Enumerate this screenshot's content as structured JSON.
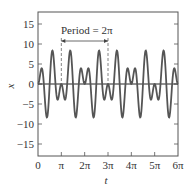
{
  "chart_data": {
    "type": "line",
    "title": "",
    "xlabel": "t",
    "ylabel": "x",
    "xlim": [
      0,
      18.8496
    ],
    "ylim": [
      -18,
      18
    ],
    "grid": false,
    "legend": null,
    "x_ticks": [
      {
        "value": 0,
        "label": "0"
      },
      {
        "value": 3.1416,
        "label": "π"
      },
      {
        "value": 6.2832,
        "label": "2π"
      },
      {
        "value": 9.4248,
        "label": "3π"
      },
      {
        "value": 12.5664,
        "label": "4π"
      },
      {
        "value": 15.708,
        "label": "5π"
      },
      {
        "value": 18.8496,
        "label": "6π"
      }
    ],
    "y_ticks": [
      {
        "value": 15,
        "label": "15"
      },
      {
        "value": 10,
        "label": "10"
      },
      {
        "value": 5,
        "label": "5"
      },
      {
        "value": 0,
        "label": "0"
      },
      {
        "value": -5,
        "label": "−5"
      },
      {
        "value": -10,
        "label": "−10"
      },
      {
        "value": -15,
        "label": "−15"
      }
    ],
    "series": [
      {
        "name": "x(t)",
        "formula": "x = 4.5[cos(3t) − cos(5t)] = 9 sin(t) sin(4t)",
        "amplitude": 4.5,
        "freq_a": 3,
        "freq_b": 5,
        "t_start": 0,
        "t_end": 18.8496,
        "samples": 600
      }
    ],
    "annotations": [
      {
        "text": "Period = 2π",
        "from": 3.1416,
        "to": 9.4248,
        "type": "double-arrow-with-dashed-guides"
      }
    ]
  },
  "colors": {
    "curve": "#555555",
    "axes": "#444444",
    "text": "#333333"
  }
}
